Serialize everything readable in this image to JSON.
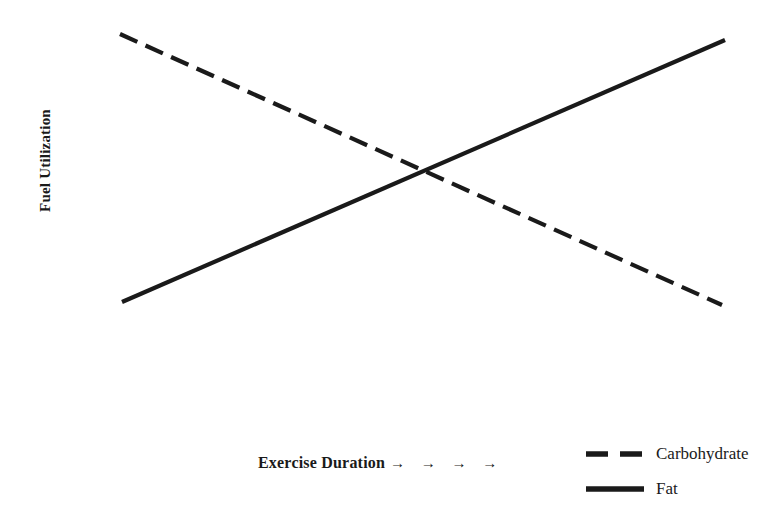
{
  "chart_data": {
    "type": "line",
    "title": "",
    "subtitle": "",
    "xlabel": "Exercise Duration",
    "xlabel_arrows": "→ → → →",
    "ylabel": "Fuel Utilization",
    "xticklabels": [],
    "yticklabels": [],
    "xlim": [
      0,
      1
    ],
    "ylim": [
      0,
      1
    ],
    "grid": false,
    "axes_visible": false,
    "background_color": "#ffffff",
    "line_color": "#1a1a1a",
    "line_width_px": 4,
    "legend_position": "bottom-right",
    "crossing_point": {
      "x": 0.505,
      "y": 0.5
    },
    "series": [
      {
        "name": "Carbohydrate",
        "style": "dashed",
        "color": "#1a1a1a",
        "dash_pattern_px": [
          19,
          9
        ],
        "x": [
          0,
          1
        ],
        "values": [
          1.0,
          0.0
        ],
        "pixel_start": {
          "x": 120,
          "y": 34
        },
        "pixel_end": {
          "x": 722,
          "y": 305
        },
        "trend": "decreasing"
      },
      {
        "name": "Fat",
        "style": "solid",
        "color": "#1a1a1a",
        "x": [
          0,
          1
        ],
        "values": [
          0.0,
          1.0
        ],
        "pixel_start": {
          "x": 122,
          "y": 302
        },
        "pixel_end": {
          "x": 725,
          "y": 40
        },
        "trend": "increasing"
      }
    ],
    "legend": [
      {
        "label": "Carbohydrate",
        "style": "dashed"
      },
      {
        "label": "Fat",
        "style": "solid"
      }
    ]
  }
}
